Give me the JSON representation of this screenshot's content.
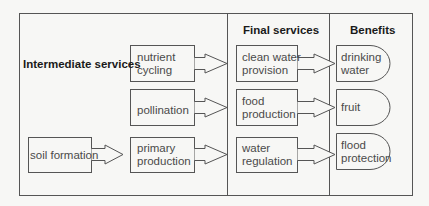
{
  "headers": {
    "intermediate": "Intermediate services",
    "final": "Final services",
    "benefits": "Benefits"
  },
  "intermediate": [
    {
      "line1": "nutrient",
      "line2": "cycling"
    },
    {
      "line1": "pollination",
      "line2": ""
    },
    {
      "line1": "primary",
      "line2": "production"
    }
  ],
  "source": {
    "label": "soil formation"
  },
  "final": [
    {
      "line1": "clean water",
      "line2": "provision"
    },
    {
      "line1": "food",
      "line2": "production"
    },
    {
      "line1": "water",
      "line2": "regulation"
    }
  ],
  "benefits": [
    {
      "line1": "drinking",
      "line2": "water"
    },
    {
      "line1": "fruit",
      "line2": ""
    },
    {
      "line1": "flood",
      "line2": "protection"
    }
  ],
  "colors": {
    "stroke": "#555555",
    "background": "#f7f7f5",
    "text": "#4a4a4a"
  }
}
